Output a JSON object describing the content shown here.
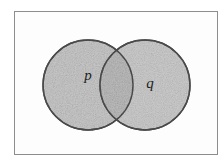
{
  "figure": {
    "kind": "venn-diagram",
    "caption": "",
    "canvas": {
      "width": 224,
      "height": 164,
      "background": "#ffffff"
    },
    "frame": {
      "name": "universal-set-rectangle",
      "x": 14,
      "y": 11,
      "width": 204,
      "height": 144,
      "stroke": "#8d8d8d",
      "stroke_width": 1,
      "fill": "#fdfdfd"
    },
    "sets": [
      {
        "id": "p",
        "label": "p",
        "cx": 88,
        "cy": 85,
        "r": 45,
        "fill": "#c9c9c9",
        "stroke": "#4f4f4f",
        "stroke_width": 1.4,
        "label_x": 88,
        "label_y": 80,
        "label_size": 15
      },
      {
        "id": "q",
        "label": "q",
        "cx": 145,
        "cy": 85,
        "r": 45,
        "fill": "#c4c4c4",
        "stroke": "#4f4f4f",
        "stroke_width": 1.4,
        "label_x": 150,
        "label_y": 88,
        "label_size": 15
      }
    ],
    "intersection": {
      "name": "p-and-q-overlap",
      "fill": "#b8b8b8",
      "left_arc_from_circle": "q",
      "right_arc_from_circle": "p"
    },
    "palette": {
      "background": "#ffffff",
      "frame_stroke": "#8d8d8d",
      "circle_fill": "#c9c9c9",
      "circle_stroke": "#4f4f4f",
      "overlap_fill": "#b8b8b8",
      "label_color": "#1d1d1d"
    }
  }
}
